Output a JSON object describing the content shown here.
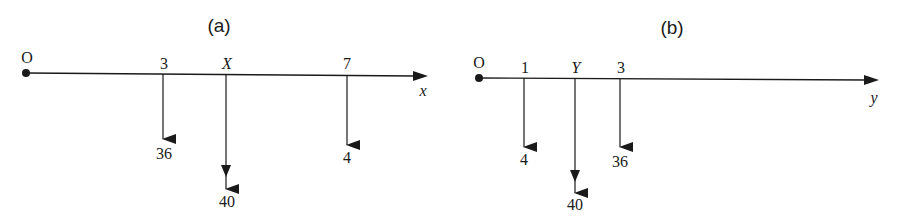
{
  "panels": [
    {
      "caption": "(a)",
      "origin_label": "O",
      "axis_label": "x",
      "ticks": [
        {
          "label": "3",
          "value": "36"
        },
        {
          "label": "X",
          "value": "40"
        },
        {
          "label": "7",
          "value": "4"
        }
      ]
    },
    {
      "caption": "(b)",
      "origin_label": "O",
      "axis_label": "y",
      "ticks": [
        {
          "label": "1",
          "value": "4"
        },
        {
          "label": "Y",
          "value": "40"
        },
        {
          "label": "3",
          "value": "36"
        }
      ]
    }
  ],
  "colors": {
    "ink": "#1a1a1a",
    "background": "#ffffff"
  }
}
